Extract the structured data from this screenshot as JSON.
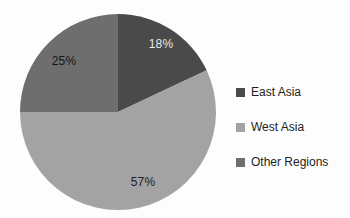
{
  "chart_data": {
    "type": "pie",
    "title": "",
    "categories": [
      "East Asia",
      "West Asia",
      "Other Regions"
    ],
    "values": [
      18,
      57,
      25
    ],
    "value_labels": [
      "18%",
      "57%",
      "25%"
    ],
    "unit": "%",
    "start_angle_deg": 0,
    "direction": "clockwise",
    "legend_position": "right",
    "grid": false,
    "colors": [
      "#4a4a4a",
      "#a3a3a3",
      "#6e6e6e"
    ],
    "slices": [
      {
        "name": "East Asia",
        "value": 18,
        "label": "18%",
        "color": "#4a4a4a",
        "label_color": "#e9e9e9",
        "label_x": 161,
        "label_y": 44
      },
      {
        "name": "West Asia",
        "value": 57,
        "label": "57%",
        "color": "#a3a3a3",
        "label_color": "#1c1c1c",
        "label_x": 143,
        "label_y": 182
      },
      {
        "name": "Other Regions",
        "value": 25,
        "label": "25%",
        "color": "#6e6e6e",
        "label_color": "#151515",
        "label_x": 64,
        "label_y": 61
      }
    ]
  },
  "pie": {
    "center_x": 118,
    "center_y": 112,
    "radius": 98
  },
  "legend": {
    "items": [
      {
        "label": "East Asia",
        "color": "#4a4a4a"
      },
      {
        "label": "West Asia",
        "color": "#a3a3a3"
      },
      {
        "label": "Other Regions",
        "color": "#6e6e6e"
      }
    ]
  },
  "background": "#fdfdfd"
}
